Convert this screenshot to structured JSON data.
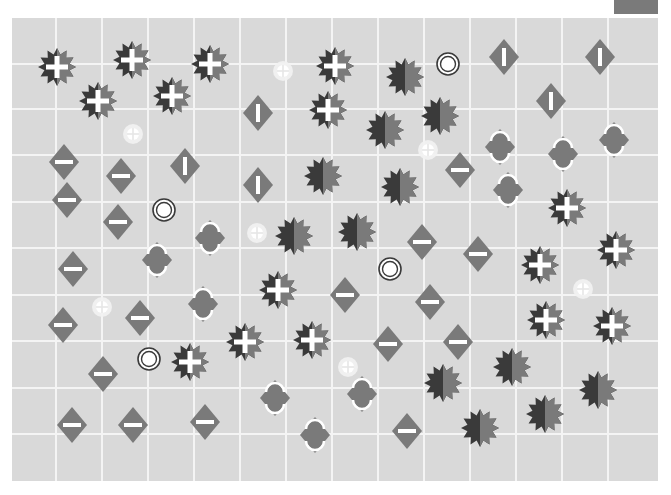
{
  "game": {
    "board": {
      "left": 12,
      "top": 18,
      "width": 646,
      "height": 463,
      "background": "#d9d9d9",
      "grid_color": "#f4f4f4",
      "vertical_lines_x": [
        56,
        102,
        148,
        194,
        240,
        286,
        332,
        378,
        424,
        470,
        516,
        562,
        608
      ],
      "horizontal_lines_y": [
        64,
        109,
        155,
        202,
        248,
        295,
        341,
        388,
        434
      ]
    },
    "colors": {
      "dark": "#3a3a3a",
      "mid": "#7a7a7a",
      "white": "#ffffff",
      "glow": "#f2f2f2",
      "corner_tab": "#7a7a7a"
    },
    "pieces": {
      "plus_stars": [
        [
          57,
          67
        ],
        [
          132,
          60
        ],
        [
          210,
          64
        ],
        [
          98,
          101
        ],
        [
          172,
          96
        ],
        [
          335,
          66
        ],
        [
          328,
          110
        ],
        [
          567,
          208
        ],
        [
          540,
          265
        ],
        [
          616,
          250
        ],
        [
          278,
          290
        ],
        [
          546,
          320
        ],
        [
          612,
          326
        ],
        [
          245,
          342
        ],
        [
          312,
          340
        ],
        [
          190,
          362
        ]
      ],
      "split_stars": [
        [
          405,
          77
        ],
        [
          440,
          116
        ],
        [
          385,
          130
        ],
        [
          323,
          176
        ],
        [
          400,
          187
        ],
        [
          294,
          236
        ],
        [
          357,
          232
        ],
        [
          443,
          383
        ],
        [
          512,
          367
        ],
        [
          598,
          390
        ],
        [
          480,
          428
        ],
        [
          545,
          414
        ]
      ],
      "vertical_bar_diamonds": [
        [
          504,
          57
        ],
        [
          600,
          57
        ],
        [
          258,
          113
        ],
        [
          551,
          101
        ],
        [
          185,
          166
        ],
        [
          258,
          185
        ]
      ],
      "horizontal_bar_diamonds": [
        [
          64,
          162
        ],
        [
          67,
          200
        ],
        [
          121,
          176
        ],
        [
          118,
          222
        ],
        [
          460,
          170
        ],
        [
          73,
          269
        ],
        [
          422,
          242
        ],
        [
          478,
          254
        ],
        [
          345,
          295
        ],
        [
          430,
          302
        ],
        [
          140,
          318
        ],
        [
          63,
          325
        ],
        [
          388,
          344
        ],
        [
          458,
          342
        ],
        [
          103,
          374
        ],
        [
          72,
          425
        ],
        [
          133,
          425
        ],
        [
          205,
          422
        ],
        [
          407,
          431
        ]
      ],
      "hourglass_diamonds": [
        [
          500,
          147
        ],
        [
          563,
          154
        ],
        [
          614,
          140
        ],
        [
          508,
          190
        ],
        [
          210,
          238
        ],
        [
          157,
          260
        ],
        [
          203,
          304
        ],
        [
          275,
          398
        ],
        [
          362,
          394
        ],
        [
          315,
          435
        ]
      ],
      "rings": [
        [
          448,
          64
        ],
        [
          164,
          210
        ],
        [
          390,
          269
        ],
        [
          149,
          359
        ]
      ],
      "glow_targets": [
        [
          283,
          71
        ],
        [
          133,
          134
        ],
        [
          428,
          150
        ],
        [
          257,
          233
        ],
        [
          102,
          307
        ],
        [
          583,
          289
        ],
        [
          348,
          367
        ]
      ]
    }
  }
}
